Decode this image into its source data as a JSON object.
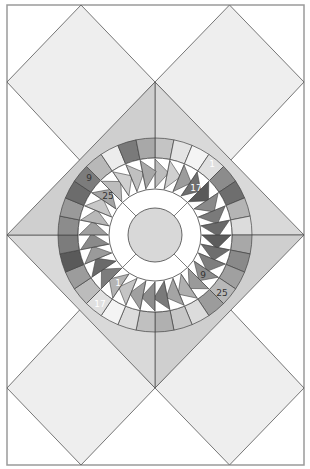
{
  "diagram": {
    "type": "quilt-block-layout",
    "frame": {
      "x": 7,
      "y": 5,
      "width": 297,
      "height": 460,
      "stroke": "#9a9a9a"
    },
    "center": {
      "x": 155,
      "y": 235
    },
    "colors": {
      "background": "#ffffff",
      "diamond_fill": "#eeeeee",
      "kite_fill": "#cfcfcf",
      "kite_fill_alt": "#d9d9d9",
      "outline": "#444444",
      "center_disc": "#d8d8d8",
      "white_ring": "#ffffff",
      "label_dark": "#333333",
      "label_light": "#ffffff"
    },
    "radii": {
      "outer_ring_outer": 97,
      "outer_ring_inner": 77,
      "geese_outer": 77,
      "geese_inner": 46,
      "white_ring_outer": 46,
      "center_disc": 27
    },
    "outer_ring": {
      "segments": 32,
      "start_angle_deg": -90,
      "shades": [
        "#c4c4c4",
        "#e4e4e4",
        "#f4f4f4",
        "#e0e0e0",
        "#8c8c8c",
        "#6e6e6e",
        "#b4b4b4",
        "#dcdcdc",
        "#a8a8a8",
        "#8a8a8a",
        "#a0a0a0",
        "#b8b8b8",
        "#9c9c9c",
        "#dcdcdc",
        "#c8c8c8",
        "#b0b0b0",
        "#c0c0c0",
        "#dcdcdc",
        "#f4f4f4",
        "#e0e0e0",
        "#bcbcbc",
        "#9c9c9c",
        "#5a5a5a",
        "#7c7c7c",
        "#8c8c8c",
        "#9a9a9a",
        "#6c6c6c",
        "#7c7c7c",
        "#b8b8b8",
        "#ececec",
        "#7a7a7a",
        "#a8a8a8"
      ]
    },
    "geese_ring": {
      "count": 32,
      "shades": [
        "#bdbdbd",
        "#d0d0d0",
        "#9c9c9c",
        "#6e6e6e",
        "#5a5a5a",
        "#8a8a8a",
        "#7a7a7a",
        "#6a6a6a",
        "#5c5c5c",
        "#6e6e6e",
        "#7e7e7e",
        "#8e8e8e",
        "#9a9a9a",
        "#b0b0b0",
        "#a4a4a4",
        "#7a7a7a",
        "#8e8e8e",
        "#a0a0a0",
        "#c4c4c4",
        "#b4b4b4",
        "#7c7c7c",
        "#6a6a6a",
        "#9a9a9a",
        "#8a8a8a",
        "#a0a0a0",
        "#b8b8b8",
        "#c8c8c8",
        "#a4a4a4",
        "#bcbcbc",
        "#d0d0d0",
        "#c0c0c0",
        "#a8a8a8"
      ]
    },
    "labels": [
      {
        "text": "1",
        "x": 212,
        "y": 164,
        "color": "#ffffff"
      },
      {
        "text": "17",
        "x": 196,
        "y": 188,
        "color": "#ffffff"
      },
      {
        "text": "9",
        "x": 89,
        "y": 178,
        "color": "#333333"
      },
      {
        "text": "25",
        "x": 108,
        "y": 196,
        "color": "#333333"
      },
      {
        "text": "1",
        "x": 118,
        "y": 283,
        "color": "#ffffff"
      },
      {
        "text": "17",
        "x": 100,
        "y": 304,
        "color": "#ffffff"
      },
      {
        "text": "9",
        "x": 203,
        "y": 275,
        "color": "#333333"
      },
      {
        "text": "25",
        "x": 222,
        "y": 293,
        "color": "#333333"
      }
    ]
  }
}
